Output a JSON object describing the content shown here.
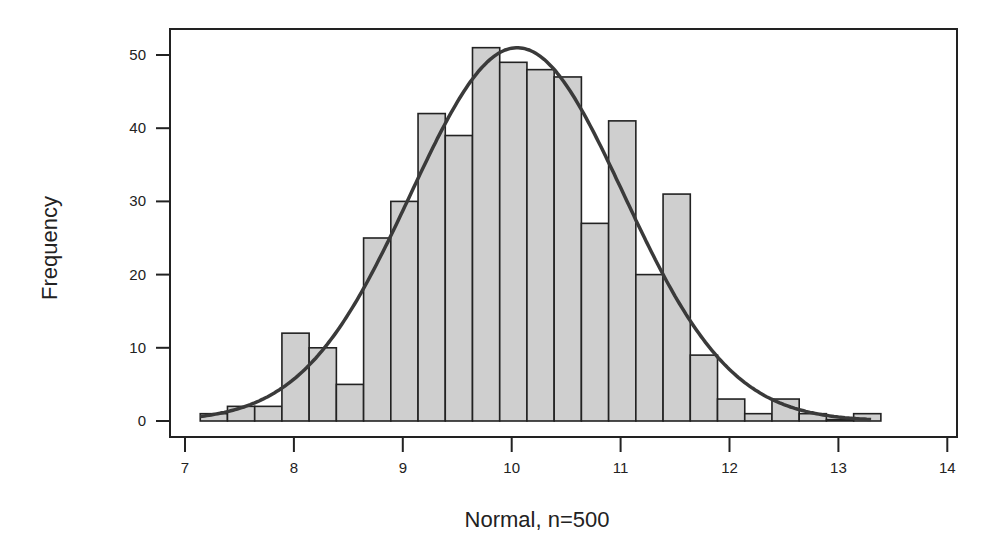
{
  "chart_data": {
    "type": "bar",
    "subtype": "histogram_with_normal_fit",
    "title": "",
    "xlabel": "Normal, n=500",
    "ylabel": "Frequency",
    "xlim": [
      7,
      14
    ],
    "ylim": [
      0,
      50
    ],
    "xticks": [
      7,
      8,
      9,
      10,
      11,
      12,
      13,
      14
    ],
    "yticks": [
      0,
      10,
      20,
      30,
      40,
      50
    ],
    "grid": false,
    "legend": null,
    "bin_start": 7.14,
    "bin_width": 0.25,
    "bin_edges": [
      7.14,
      7.39,
      7.64,
      7.89,
      8.14,
      8.39,
      8.64,
      8.89,
      9.14,
      9.39,
      9.64,
      9.89,
      10.14,
      10.39,
      10.64,
      10.89,
      11.14,
      11.39,
      11.64,
      11.89,
      12.14,
      12.39,
      12.64,
      12.89,
      13.14,
      13.39
    ],
    "values": [
      1,
      2,
      2,
      12,
      10,
      5,
      25,
      30,
      42,
      39,
      51,
      49,
      48,
      47,
      27,
      41,
      20,
      31,
      9,
      3,
      1,
      3,
      1,
      0,
      1
    ],
    "fit_curve": {
      "type": "normal",
      "mean": 10.05,
      "sd": 0.98,
      "peak": 51
    },
    "colors": {
      "bar_fill": "#cfcfcf",
      "bar_edge": "#222222",
      "curve": "#3a3a3a",
      "frame": "#222222"
    }
  }
}
